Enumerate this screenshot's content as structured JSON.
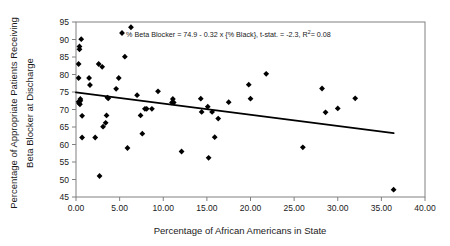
{
  "chart_data": {
    "type": "scatter",
    "title": "",
    "xlabel": "Percentage of African Americans in State",
    "ylabel": "Percentage of Appropriate Patients Receiving Beta Blocker at Discharge",
    "ylabel_line1": "Percentage of Appropriate Patients Receiving",
    "ylabel_line2": "Beta Blocker at Discharge",
    "xlim": [
      0,
      40
    ],
    "ylim": [
      45,
      95
    ],
    "xticks": [
      "0.00",
      "5.00",
      "10.00",
      "15.00",
      "20.00",
      "25.00",
      "30.00",
      "35.00",
      "40.00"
    ],
    "xtick_values": [
      0,
      5,
      10,
      15,
      20,
      25,
      30,
      35,
      40
    ],
    "yticks": [
      "45",
      "50",
      "55",
      "60",
      "65",
      "70",
      "75",
      "80",
      "85",
      "90",
      "95"
    ],
    "ytick_values": [
      45,
      50,
      55,
      60,
      65,
      70,
      75,
      80,
      85,
      90,
      95
    ],
    "grid": false,
    "legend": "none",
    "annotation": {
      "text_before_sup": "% Beta Blocker = 74.9 - 0.32 x {% Black},  t-stat. = -2.3, R",
      "superscript": "2",
      "text_after_sup": "= 0.08",
      "full_text": "% Beta Blocker = 74.9 - 0.32 x {% Black},  t-stat. = -2.3, R2= 0.08",
      "marker": "diamond"
    },
    "regression": {
      "intercept": 74.9,
      "slope": -0.32,
      "t_stat": -2.3,
      "r_squared": 0.08,
      "x_start": 0.0,
      "x_end": 36.4,
      "y_start": 74.9,
      "y_end": 63.25
    },
    "series": [
      {
        "name": "States",
        "marker": "diamond",
        "color": "#000000",
        "points": [
          [
            0.3,
            83.0
          ],
          [
            0.3,
            79.0
          ],
          [
            0.4,
            87.2
          ],
          [
            0.4,
            88.0
          ],
          [
            0.6,
            90.1
          ],
          [
            0.5,
            73.0
          ],
          [
            0.3,
            72.2
          ],
          [
            0.35,
            71.8
          ],
          [
            0.45,
            71.5
          ],
          [
            0.5,
            72.5
          ],
          [
            0.7,
            68.2
          ],
          [
            0.7,
            62.0
          ],
          [
            1.5,
            79.0
          ],
          [
            1.6,
            77.0
          ],
          [
            2.2,
            62.0
          ],
          [
            2.6,
            83.0
          ],
          [
            2.7,
            51.0
          ],
          [
            3.0,
            82.2
          ],
          [
            3.1,
            65.1
          ],
          [
            3.4,
            66.2
          ],
          [
            3.5,
            68.3
          ],
          [
            3.6,
            73.4
          ],
          [
            3.7,
            73.2
          ],
          [
            4.6,
            75.9
          ],
          [
            4.9,
            79.0
          ],
          [
            5.6,
            85.1
          ],
          [
            5.9,
            59.0
          ],
          [
            6.3,
            93.5
          ],
          [
            7.0,
            74.1
          ],
          [
            7.4,
            68.3
          ],
          [
            7.6,
            63.1
          ],
          [
            7.9,
            70.2
          ],
          [
            8.1,
            70.2
          ],
          [
            8.7,
            70.2
          ],
          [
            9.4,
            75.2
          ],
          [
            11.0,
            72.0
          ],
          [
            11.1,
            73.0
          ],
          [
            11.2,
            72.0
          ],
          [
            12.1,
            58.0
          ],
          [
            14.3,
            73.1
          ],
          [
            14.4,
            69.3
          ],
          [
            15.1,
            70.8
          ],
          [
            15.2,
            56.2
          ],
          [
            15.6,
            69.3
          ],
          [
            15.9,
            62.1
          ],
          [
            16.3,
            67.4
          ],
          [
            17.5,
            72.1
          ],
          [
            19.8,
            77.1
          ],
          [
            20.0,
            73.1
          ],
          [
            21.8,
            80.2
          ],
          [
            26.0,
            59.2
          ],
          [
            28.2,
            76.0
          ],
          [
            28.6,
            69.2
          ],
          [
            30.0,
            70.3
          ],
          [
            32.0,
            73.2
          ],
          [
            36.4,
            47.1
          ]
        ]
      }
    ]
  }
}
